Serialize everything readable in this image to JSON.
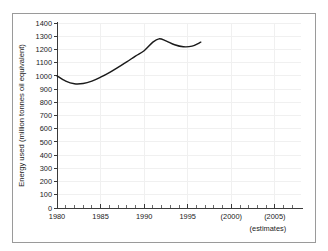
{
  "figure": {
    "background_color": "#ffffff",
    "border_color": "#9a9a9a",
    "axis_color": "#3a3a3a",
    "grid_color": "#f0f0f0",
    "series_color": "#1a1a1a"
  },
  "chart_data": {
    "type": "line",
    "title": "",
    "xlabel": "",
    "ylabel": "Energy used (million tonnes oil equivalent)",
    "xlim": [
      1980,
      2008
    ],
    "ylim": [
      0,
      1400
    ],
    "grid": true,
    "legend": "none",
    "y_ticks": [
      0,
      100,
      200,
      300,
      400,
      500,
      600,
      700,
      800,
      900,
      1000,
      1100,
      1200,
      1300,
      1400
    ],
    "y_tick_labels": [
      "0",
      "100",
      "200",
      "300",
      "400",
      "500",
      "600",
      "700",
      "800",
      "900",
      "1000",
      "1100",
      "1200",
      "1300",
      "1400"
    ],
    "x_ticks": [
      1980,
      1985,
      1990,
      1995,
      2000,
      2005
    ],
    "x_tick_labels": [
      "1980",
      "1985",
      "1990",
      "1995",
      "(2000)",
      "(2005)"
    ],
    "x_minor_tick_step": 1,
    "annotations": [
      {
        "name": "estimates-note",
        "text": "(estimates)"
      }
    ],
    "series": [
      {
        "name": "Energy used",
        "x": [
          1980,
          1981,
          1982,
          1983,
          1984,
          1985,
          1986,
          1987,
          1988,
          1989,
          1990,
          1991,
          1991.7,
          1992.5,
          1993.5,
          1994.5,
          1995.5,
          1996.5
        ],
        "values": [
          1000,
          960,
          940,
          942,
          960,
          990,
          1025,
          1065,
          1105,
          1150,
          1190,
          1255,
          1280,
          1265,
          1235,
          1220,
          1225,
          1255
        ]
      }
    ]
  }
}
